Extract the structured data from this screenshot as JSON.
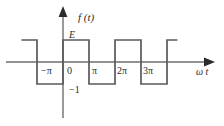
{
  "figure": {
    "title": "",
    "axis": {
      "vertical_label": "f (t)",
      "horizontal_label": "ω t",
      "origin_label": "0"
    },
    "value_labels": {
      "high": "E",
      "low": "−1"
    },
    "x_tick_labels": [
      "−π",
      "0",
      "π",
      "2π",
      "3π"
    ],
    "colors": {
      "wave": "#5a5a5a",
      "axis": "#6e6e6e",
      "text": "#2b2b2b",
      "background": "#ffffff"
    }
  },
  "chart_data": {
    "type": "line",
    "title": "",
    "xlabel": "ω t",
    "ylabel": "f (t)",
    "xlim": [
      -1.6,
      5.3
    ],
    "ylim": [
      -1.45,
      1.45
    ],
    "grid": false,
    "legend": null,
    "x_tick_values": [
      -1,
      0,
      1,
      2,
      3
    ],
    "x_tick_labels": [
      "−π",
      "0",
      "π",
      "2π",
      "3π"
    ],
    "y_tick_values": [
      1,
      -1
    ],
    "y_tick_labels": [
      "E",
      "−1"
    ],
    "series": [
      {
        "name": "f (t)",
        "points": [
          {
            "x": -1.6,
            "y": 1
          },
          {
            "x": -1.0,
            "y": 1
          },
          {
            "x": -1.0,
            "y": -1
          },
          {
            "x": 0.0,
            "y": -1
          },
          {
            "x": 0.0,
            "y": 1
          },
          {
            "x": 1.0,
            "y": 1
          },
          {
            "x": 1.0,
            "y": -1
          },
          {
            "x": 2.0,
            "y": -1
          },
          {
            "x": 2.0,
            "y": 1
          },
          {
            "x": 3.0,
            "y": 1
          },
          {
            "x": 3.0,
            "y": -1
          },
          {
            "x": 4.0,
            "y": -1
          },
          {
            "x": 4.0,
            "y": 1
          },
          {
            "x": 4.4,
            "y": 1
          }
        ]
      }
    ]
  }
}
